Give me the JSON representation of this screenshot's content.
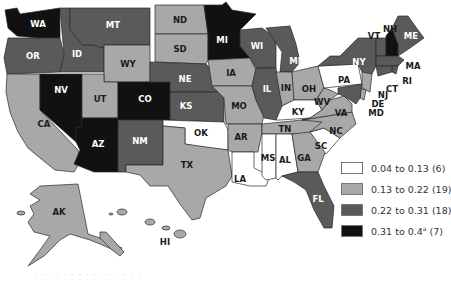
{
  "legend": {
    "items": [
      {
        "label": "0.04 to 0.13 (6)",
        "color": "#ffffff"
      },
      {
        "label": "0.13 to 0.22 (19)",
        "color": "#a8a8a8"
      },
      {
        "label": "0.22 to 0.31 (18)",
        "color": "#5a5a5a"
      },
      {
        "label": "0.31 to 0.4",
        "sup": "a",
        "count": " (7)",
        "color": "#111111"
      }
    ]
  },
  "colors": {
    "c1": "#ffffff",
    "c2": "#a8a8a8",
    "c3": "#5a5a5a",
    "c4": "#111111",
    "border": "#2a2a2a"
  },
  "states": [
    {
      "abbr": "WA",
      "class": 4
    },
    {
      "abbr": "OR",
      "class": 3
    },
    {
      "abbr": "CA",
      "class": 2
    },
    {
      "abbr": "ID",
      "class": 3
    },
    {
      "abbr": "NV",
      "class": 4
    },
    {
      "abbr": "MT",
      "class": 3
    },
    {
      "abbr": "WY",
      "class": 2
    },
    {
      "abbr": "UT",
      "class": 2
    },
    {
      "abbr": "AZ",
      "class": 4
    },
    {
      "abbr": "CO",
      "class": 4
    },
    {
      "abbr": "NM",
      "class": 3
    },
    {
      "abbr": "ND",
      "class": 2
    },
    {
      "abbr": "SD",
      "class": 2
    },
    {
      "abbr": "NE",
      "class": 3
    },
    {
      "abbr": "KS",
      "class": 3
    },
    {
      "abbr": "OK",
      "class": 1
    },
    {
      "abbr": "TX",
      "class": 2
    },
    {
      "abbr": "MN",
      "label": "MI",
      "class": 4
    },
    {
      "abbr": "IA",
      "class": 2
    },
    {
      "abbr": "MO",
      "class": 2
    },
    {
      "abbr": "AR",
      "class": 2
    },
    {
      "abbr": "LA",
      "class": 1
    },
    {
      "abbr": "WI",
      "class": 3
    },
    {
      "abbr": "IL",
      "class": 3
    },
    {
      "abbr": "MI",
      "class": 3
    },
    {
      "abbr": "IN",
      "class": 2
    },
    {
      "abbr": "OH",
      "class": 2
    },
    {
      "abbr": "KY",
      "class": 1
    },
    {
      "abbr": "TN",
      "class": 2
    },
    {
      "abbr": "MS",
      "class": 1
    },
    {
      "abbr": "AL",
      "class": 1
    },
    {
      "abbr": "GA",
      "class": 2
    },
    {
      "abbr": "FL",
      "class": 3
    },
    {
      "abbr": "SC",
      "class": 1
    },
    {
      "abbr": "NC",
      "class": 2
    },
    {
      "abbr": "VA",
      "class": 2
    },
    {
      "abbr": "WV",
      "class": 2
    },
    {
      "abbr": "PA",
      "class": 1
    },
    {
      "abbr": "NY",
      "class": 3
    },
    {
      "abbr": "VT",
      "class": 3
    },
    {
      "abbr": "NH",
      "class": 4
    },
    {
      "abbr": "ME",
      "class": 3
    },
    {
      "abbr": "MA",
      "class": 3
    },
    {
      "abbr": "RI",
      "class": 3
    },
    {
      "abbr": "CT",
      "class": 3
    },
    {
      "abbr": "NJ",
      "class": 2
    },
    {
      "abbr": "DE",
      "class": 2
    },
    {
      "abbr": "MD",
      "class": 3
    },
    {
      "abbr": "AK",
      "class": 2
    },
    {
      "abbr": "HI",
      "class": 2
    }
  ],
  "labels": {
    "WA": "WA",
    "OR": "OR",
    "CA": "CA",
    "ID": "ID",
    "NV": "NV",
    "MT": "MT",
    "WY": "WY",
    "UT": "UT",
    "AZ": "AZ",
    "CO": "CO",
    "NM": "NM",
    "ND": "ND",
    "SD": "SD",
    "NE": "NE",
    "KS": "KS",
    "OK": "OK",
    "TX": "TX",
    "MN": "MI",
    "IA": "IA",
    "MO": "MO",
    "AR": "AR",
    "LA": "LA",
    "WI": "WI",
    "IL": "IL",
    "MI": "MI",
    "IN": "IN",
    "OH": "OH",
    "KY": "KY",
    "TN": "TN",
    "MS": "MS",
    "AL": "AL",
    "GA": "GA",
    "FL": "FL",
    "SC": "SC",
    "NC": "NC",
    "VA": "VA",
    "WV": "WV",
    "PA": "PA",
    "NY": "NY",
    "VT": "VT",
    "NH": "NH",
    "ME": "ME",
    "MA": "MA",
    "RI": "RI",
    "CT": "CT",
    "NJ": "NJ",
    "DE": "DE",
    "MD": "MD",
    "AK": "AK",
    "HI": "HI"
  },
  "footnote": "· · · · · · · · · · · ·     · · ·"
}
